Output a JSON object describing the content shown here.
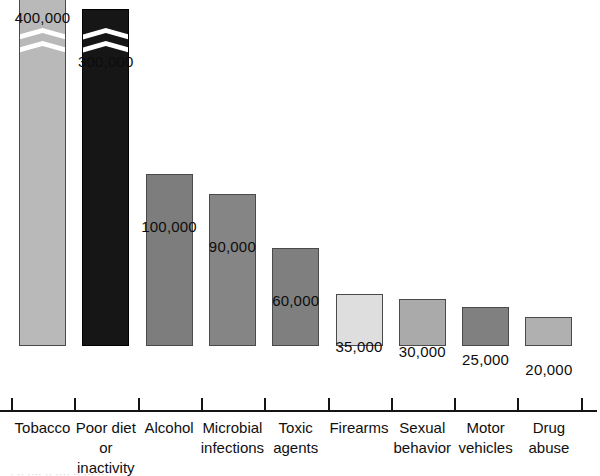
{
  "chart_data": {
    "type": "bar",
    "title": "",
    "subtitle": "",
    "xlabel": "",
    "ylabel": "",
    "grid": false,
    "legend": null,
    "axis_break": {
      "present": true,
      "applies_to": [
        "Tobacco",
        "Poor diet or inactivity"
      ],
      "note": "White chevron break drawn across the two tallest bars"
    },
    "ylim": [
      0,
      400000
    ],
    "categories": [
      "Tobacco",
      "Poor diet\nor inactivity",
      "Alcohol",
      "Microbial\ninfections",
      "Toxic\nagents",
      "Firearms",
      "Sexual\nbehavior",
      "Motor\nvehicles",
      "Drug\nabuse"
    ],
    "values": [
      400000,
      300000,
      100000,
      90000,
      60000,
      35000,
      30000,
      25000,
      20000
    ],
    "value_labels": [
      "400,000",
      "300,000",
      "100,000",
      "90,000",
      "60,000",
      "35,000",
      "30,000",
      "25,000",
      "20,000"
    ],
    "bar_colors": [
      "#b9b9b9",
      "#161616",
      "#7d7d7d",
      "#858585",
      "#7f7f7f",
      "#dedede",
      "#aaaaaa",
      "#808080",
      "#b0b0b0"
    ],
    "bar_border_color": "#4a4a4a",
    "axis_color": "#141414",
    "background": "#ffffff",
    "text_color": "#101010"
  },
  "caption": {
    "sliver_text": "· ·· ···· ·· ···· ·· ··· ··"
  }
}
